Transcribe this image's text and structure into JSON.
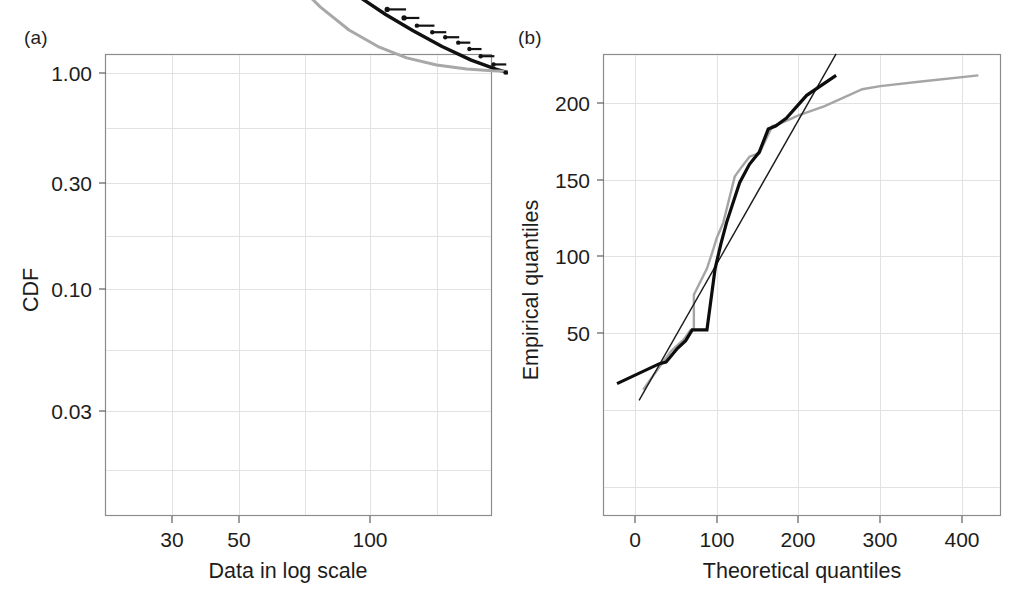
{
  "figure": {
    "panel_a_label": "(a)",
    "panel_b_label": "(b)"
  },
  "chart_data": [
    {
      "id": "panel_a",
      "type": "line",
      "title": "",
      "panel_label": "(a)",
      "xlabel": "Data in log scale",
      "ylabel": "CDF",
      "xscale": "log",
      "yscale": "log",
      "xlim": [
        20,
        250
      ],
      "ylim": [
        0.012,
        1.15
      ],
      "xticks": [
        30,
        50,
        100
      ],
      "xtick_labels": [
        "30",
        "50",
        "100"
      ],
      "yticks": [
        0.03,
        0.1,
        0.3,
        1.0
      ],
      "ytick_labels": [
        "0.03",
        "0.10",
        "0.30",
        "1.00"
      ],
      "grid": true,
      "legend": "none",
      "series": [
        {
          "name": "empirical-cdf-steps",
          "style": "step-with-dot",
          "color": "#121212",
          "points_x": [
            21.5,
            26.5,
            33.0,
            43.5,
            47.5,
            52.0,
            53.5,
            55.5,
            77.5,
            95.0,
            111.0,
            123.0,
            133.0,
            146.0,
            158.0,
            171.0,
            183.0,
            196.0,
            212.0,
            228.0
          ],
          "points_y": [
            0.0255,
            0.068,
            0.135,
            0.193,
            0.219,
            0.254,
            0.282,
            0.327,
            0.395,
            0.455,
            0.517,
            0.565,
            0.612,
            0.655,
            0.69,
            0.73,
            0.78,
            0.84,
            0.915,
            0.995
          ],
          "step_right_x": [
            33.0,
            38.0,
            50.0,
            52.0,
            49.5,
            54.5,
            55.5,
            79.0,
            96.0,
            112.0,
            124.5,
            135.0,
            148.0,
            159.0,
            172.0,
            184.0,
            197.0,
            213.0,
            229.0,
            232.0
          ]
        },
        {
          "name": "fitted-model-black",
          "style": "smooth",
          "color": "#111111",
          "x": [
            21.0,
            24.0,
            28.0,
            33.0,
            39.0,
            46.0,
            55.0,
            65.0,
            78.0,
            93.0,
            110.0,
            130.0,
            155.0,
            185.0,
            215.0,
            232.0
          ],
          "y": [
            0.063,
            0.077,
            0.094,
            0.113,
            0.14,
            0.175,
            0.225,
            0.285,
            0.36,
            0.45,
            0.545,
            0.645,
            0.76,
            0.875,
            0.96,
            1.0
          ]
        },
        {
          "name": "fitted-model-gray",
          "style": "smooth",
          "color": "#a8a8a8",
          "x": [
            22.0,
            26.0,
            31.0,
            37.0,
            44.0,
            52.0,
            62.0,
            74.0,
            88.0,
            105.0,
            125.0,
            150.0,
            180.0,
            210.0,
            232.0
          ],
          "y": [
            0.0145,
            0.0285,
            0.055,
            0.099,
            0.165,
            0.255,
            0.375,
            0.505,
            0.64,
            0.76,
            0.855,
            0.92,
            0.96,
            0.978,
            0.985
          ]
        }
      ]
    },
    {
      "id": "panel_b",
      "type": "line",
      "title": "",
      "panel_label": "(b)",
      "xlabel": "Theoretical quantiles",
      "ylabel": "Empirical quantiles",
      "xscale": "linear",
      "yscale": "linear",
      "xlim": [
        -32,
        448
      ],
      "ylim": [
        5,
        232
      ],
      "xticks": [
        0,
        100,
        200,
        300,
        400
      ],
      "xtick_labels": [
        "0",
        "100",
        "200",
        "300",
        "400"
      ],
      "yticks": [
        50,
        100,
        150,
        200
      ],
      "ytick_labels": [
        "50",
        "100",
        "150",
        "200"
      ],
      "grid": true,
      "legend": "none",
      "series": [
        {
          "name": "qq-black-steps",
          "style": "step",
          "color": "#0d0d0d",
          "x": [
            -22,
            30,
            38,
            52,
            62,
            70,
            88,
            88,
            98,
            105,
            112,
            112,
            128,
            140,
            152,
            152,
            163,
            172,
            185,
            210,
            246
          ],
          "y": [
            17,
            30,
            31,
            40,
            45,
            52,
            52,
            52,
            92,
            108,
            122,
            122,
            148,
            160,
            168,
            168,
            183,
            185,
            190,
            205,
            218
          ]
        },
        {
          "name": "qq-gray-steps",
          "style": "step",
          "color": "#a5a5a5",
          "x": [
            10,
            30,
            44,
            60,
            68,
            72,
            72,
            88,
            96,
            100,
            108,
            108,
            122,
            130,
            140,
            150,
            152,
            168,
            175,
            192,
            200,
            232,
            278,
            300,
            350,
            420
          ],
          "y": [
            13,
            28,
            38,
            46,
            52,
            52,
            75,
            92,
            105,
            112,
            122,
            122,
            152,
            158,
            165,
            167,
            167,
            185,
            186,
            190,
            192,
            198,
            209,
            211,
            214,
            218
          ]
        },
        {
          "name": "reference-line",
          "style": "straight",
          "color": "#1a1a1a",
          "x": [
            5,
            246
          ],
          "y": [
            6,
            232
          ]
        }
      ]
    }
  ]
}
